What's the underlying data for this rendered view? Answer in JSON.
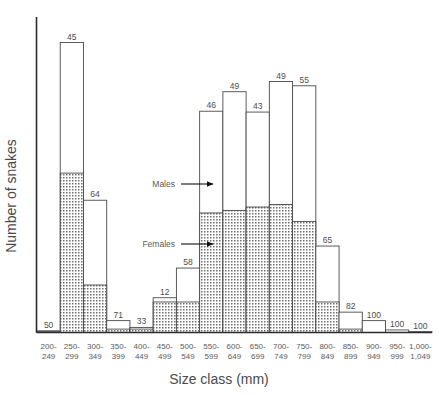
{
  "chart_data": {
    "type": "bar",
    "title": "",
    "xlabel": "Size class (mm)",
    "ylabel": "Number of snakes",
    "grid": false,
    "legend_position": "inline-annotations",
    "categories": [
      "200-\n249",
      "250-\n299",
      "300-\n349",
      "350-\n399",
      "400-\n449",
      "450-\n499",
      "500-\n549",
      "550-\n599",
      "600-\n649",
      "650-\n699",
      "700-\n749",
      "750-\n799",
      "800-\n849",
      "850-\n899",
      "900-\n949",
      "950-\n999",
      "1,000-\n1,049"
    ],
    "category_lines": [
      [
        "200-",
        "249"
      ],
      [
        "250-",
        "299"
      ],
      [
        "300-",
        "349"
      ],
      [
        "350-",
        "399"
      ],
      [
        "400-",
        "449"
      ],
      [
        "450-",
        "499"
      ],
      [
        "500-",
        "549"
      ],
      [
        "550-",
        "599"
      ],
      [
        "600-",
        "649"
      ],
      [
        "650-",
        "699"
      ],
      [
        "700-",
        "749"
      ],
      [
        "750-",
        "799"
      ],
      [
        "800-",
        "849"
      ],
      [
        "850-",
        "899"
      ],
      [
        "900-",
        "949"
      ],
      [
        "950-",
        "999"
      ],
      [
        "1,000-",
        "1,049"
      ]
    ],
    "bar_labels": [
      50,
      45,
      64,
      71,
      33,
      12,
      58,
      46,
      49,
      43,
      49,
      55,
      65,
      82,
      100,
      100,
      100
    ],
    "bar_label_meaning": "percentage of males in size class",
    "series": [
      {
        "name": "Males",
        "fill": "white",
        "values": [
          1,
          154,
          100,
          10,
          2,
          5,
          40,
          120,
          140,
          112,
          145,
          160,
          66,
          20,
          14,
          3,
          1
        ]
      },
      {
        "name": "Females",
        "fill": "stipple",
        "values": [
          1,
          188,
          56,
          4,
          4,
          36,
          36,
          141,
          144,
          148,
          151,
          131,
          36,
          4,
          0,
          0,
          0
        ]
      }
    ],
    "totals": [
      2,
      342,
      156,
      14,
      6,
      41,
      76,
      261,
      284,
      260,
      296,
      291,
      102,
      24,
      14,
      3,
      1
    ],
    "ylim": [
      0,
      345
    ],
    "annotations": [
      {
        "name": "males-annotation",
        "label": "Males",
        "points_to": "white upper bar portion"
      },
      {
        "name": "females-annotation",
        "label": "Females",
        "points_to": "stippled lower bar portion"
      }
    ]
  },
  "axis": {
    "x_title": "Size class (mm)",
    "y_title": "Number of snakes"
  },
  "annotations": {
    "males": "Males",
    "females": "Females"
  },
  "colors": {
    "axis": "#2b2b2b",
    "bar_stroke": "#4a4a4a",
    "bar_fill": "#ffffff",
    "female_fill": "#d8d8d8",
    "text": "#4d4d4d"
  }
}
